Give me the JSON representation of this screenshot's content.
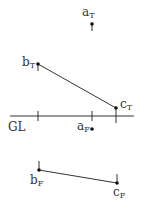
{
  "diagram": {
    "type": "orthographic-projection",
    "ground_line_label": "GL",
    "colors": {
      "line": "#333333",
      "background": "#ffffff"
    },
    "points": [
      {
        "id": "a_T",
        "base": "a",
        "sub": "T",
        "x": 92,
        "y": 24
      },
      {
        "id": "b_T",
        "base": "b",
        "sub": "T",
        "x": 38,
        "y": 64
      },
      {
        "id": "c_T",
        "base": "c",
        "sub": "T",
        "x": 116,
        "y": 108
      },
      {
        "id": "a_F",
        "base": "a",
        "sub": "F",
        "x": 92,
        "y": 128
      },
      {
        "id": "b_F",
        "base": "b",
        "sub": "F",
        "x": 39,
        "y": 170
      },
      {
        "id": "c_F",
        "base": "c",
        "sub": "F",
        "x": 117,
        "y": 183
      }
    ],
    "segments": [
      {
        "from": "b_T",
        "to": "c_T",
        "view": "top"
      },
      {
        "from": "b_F",
        "to": "c_F",
        "view": "front"
      }
    ]
  },
  "labels": {
    "gl": "GL",
    "a_T": {
      "base": "a",
      "sub": "T"
    },
    "b_T": {
      "base": "b",
      "sub": "T"
    },
    "c_T": {
      "base": "c",
      "sub": "T"
    },
    "a_F": {
      "base": "a",
      "sub": "F"
    },
    "b_F": {
      "base": "b",
      "sub": "F"
    },
    "c_F": {
      "base": "c",
      "sub": "F"
    }
  }
}
